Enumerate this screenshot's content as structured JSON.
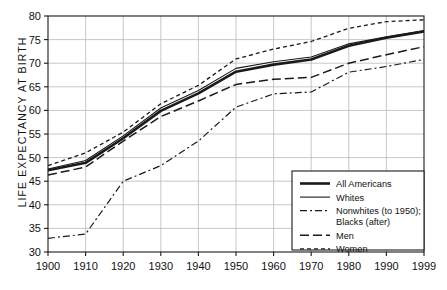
{
  "chart_data": {
    "type": "line",
    "title": "",
    "xlabel": "",
    "ylabel": "LIFE EXPECTANCY AT BIRTH",
    "xlim": [
      1900,
      1999
    ],
    "ylim": [
      30,
      80
    ],
    "grid": true,
    "legend_position": "bottom-right",
    "x_ticks": [
      "1900",
      "1910",
      "1920",
      "1930",
      "1940",
      "1950",
      "1960",
      "1970",
      "1980",
      "1990",
      "1999"
    ],
    "x_tick_values": [
      1900,
      1910,
      1920,
      1930,
      1940,
      1950,
      1960,
      1970,
      1980,
      1990,
      1999
    ],
    "y_ticks": [
      "30",
      "35",
      "40",
      "45",
      "50",
      "55",
      "60",
      "65",
      "70",
      "75",
      "80"
    ],
    "y_tick_values": [
      30,
      35,
      40,
      45,
      50,
      55,
      60,
      65,
      70,
      75,
      80
    ],
    "x": [
      1900,
      1910,
      1920,
      1930,
      1940,
      1950,
      1960,
      1970,
      1980,
      1990,
      1999
    ],
    "series": [
      {
        "name": "All Americans",
        "style": "solid-thick",
        "width": 2.6,
        "dash": "none",
        "values": [
          47.3,
          48.9,
          54.1,
          59.9,
          63.6,
          68.2,
          69.7,
          70.8,
          73.7,
          75.4,
          76.7
        ]
      },
      {
        "name": "Whites",
        "style": "solid-thin",
        "width": 1.1,
        "dash": "none",
        "values": [
          47.6,
          49.4,
          54.6,
          60.5,
          64.2,
          68.9,
          70.3,
          71.3,
          74.1,
          75.6,
          76.9
        ]
      },
      {
        "name": "Nonwhites (to 1950); Blacks (after)",
        "style": "dash-dot",
        "width": 1.2,
        "dash": "7,3,2,3",
        "values": [
          32.9,
          33.8,
          45.0,
          48.3,
          53.5,
          60.7,
          63.5,
          63.9,
          68.1,
          69.3,
          70.8
        ]
      },
      {
        "name": "Men",
        "style": "long-dash",
        "width": 1.5,
        "dash": "9,4",
        "values": [
          46.3,
          48.0,
          53.5,
          58.7,
          62.0,
          65.5,
          66.6,
          67.0,
          70.0,
          71.8,
          73.5
        ]
      },
      {
        "name": "Women",
        "style": "short-dash",
        "width": 1.3,
        "dash": "4,3",
        "values": [
          48.3,
          51.0,
          55.4,
          61.4,
          65.3,
          70.9,
          73.0,
          74.6,
          77.4,
          78.8,
          79.2
        ]
      }
    ],
    "legend_entries": [
      {
        "label": "All Americans",
        "style": "solid-thick"
      },
      {
        "label": "Whites",
        "style": "solid-thin"
      },
      {
        "label": "Nonwhites (to 1950);",
        "label2": "Blacks (after)",
        "style": "dash-dot"
      },
      {
        "label": "Men",
        "style": "long-dash"
      },
      {
        "label": "Women",
        "style": "short-dash"
      }
    ],
    "colors": {
      "line": "#1a1a1a",
      "grid": "#b9b9b9",
      "axis": "#1a1a1a",
      "background": "#ffffff",
      "legend_border": "#1a1a1a",
      "legend_background": "#ffffff"
    }
  }
}
